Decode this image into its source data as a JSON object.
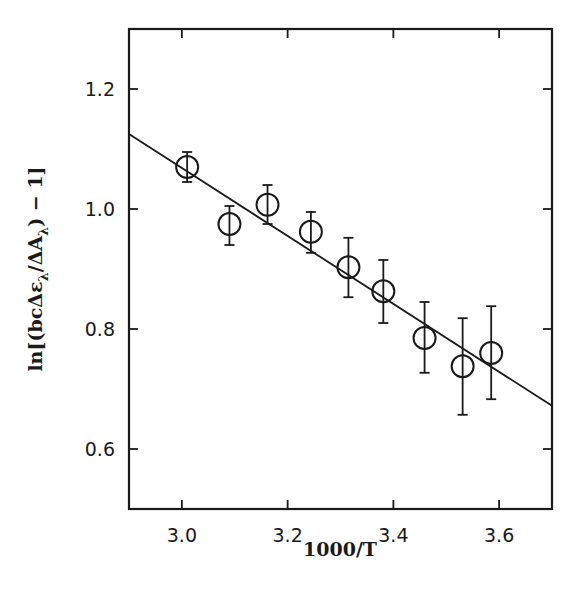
{
  "chart_data": {
    "type": "scatter",
    "title": "",
    "xlabel": "1000/T",
    "ylabel": "ln[(bcΔε_λ/ΔA_λ) − 1]",
    "ylabel_parts": {
      "prefix": "ln[(bcΔε",
      "sub1": "λ",
      "mid": "/ΔA",
      "sub2": "λ",
      "suffix": ") − 1]"
    },
    "xlim": [
      2.9,
      3.7
    ],
    "ylim": [
      0.5,
      1.3
    ],
    "xticks": [
      3.0,
      3.2,
      3.4,
      3.6
    ],
    "xtick_labels": [
      "3.0",
      "3.2",
      "3.4",
      "3.6"
    ],
    "yticks": [
      0.6,
      0.8,
      1.0,
      1.2
    ],
    "ytick_labels": [
      "0.6",
      "0.8",
      "1.0",
      "1.2"
    ],
    "grid": false,
    "legend": null,
    "series": [
      {
        "name": "data",
        "marker": "open-circle",
        "points": [
          {
            "x": 3.01,
            "y": 1.07,
            "err_low": 1.045,
            "err_high": 1.095
          },
          {
            "x": 3.09,
            "y": 0.975,
            "err_low": 0.94,
            "err_high": 1.005
          },
          {
            "x": 3.162,
            "y": 1.007,
            "err_low": 0.975,
            "err_high": 1.04
          },
          {
            "x": 3.244,
            "y": 0.962,
            "err_low": 0.927,
            "err_high": 0.995
          },
          {
            "x": 3.315,
            "y": 0.903,
            "err_low": 0.853,
            "err_high": 0.952
          },
          {
            "x": 3.381,
            "y": 0.863,
            "err_low": 0.81,
            "err_high": 0.915
          },
          {
            "x": 3.459,
            "y": 0.785,
            "err_low": 0.727,
            "err_high": 0.845
          },
          {
            "x": 3.531,
            "y": 0.738,
            "err_low": 0.657,
            "err_high": 0.818
          },
          {
            "x": 3.585,
            "y": 0.76,
            "err_low": 0.683,
            "err_high": 0.838
          }
        ]
      },
      {
        "name": "linear fit",
        "type": "line",
        "x": [
          2.9,
          3.7
        ],
        "y": [
          1.125,
          0.672
        ]
      }
    ]
  }
}
